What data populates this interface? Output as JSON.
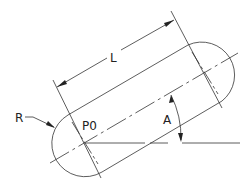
{
  "diagram": {
    "type": "slot-dimension-drawing",
    "labels": {
      "length": "L",
      "radius": "R",
      "origin": "P0",
      "angle": "A"
    },
    "colors": {
      "line": "#333333",
      "background": "#ffffff"
    }
  }
}
